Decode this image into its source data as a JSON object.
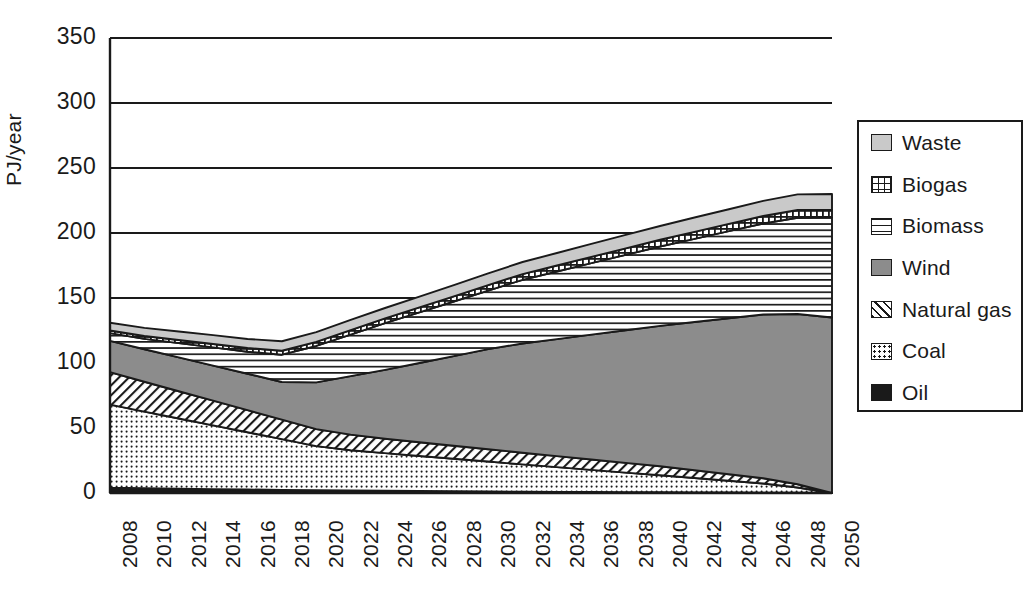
{
  "chart_data": {
    "type": "area",
    "stacked": true,
    "title": "",
    "subtitle": "",
    "xlabel": "",
    "ylabel": "PJ/year",
    "ylim": [
      0,
      350
    ],
    "ytick_values": [
      0,
      50,
      100,
      150,
      200,
      250,
      300,
      350
    ],
    "ytick_labels": [
      "0",
      "50",
      "100",
      "150",
      "200",
      "250",
      "300",
      "350"
    ],
    "grid": "horizontal",
    "legend_position": "right-outside",
    "x": [
      2008,
      2010,
      2012,
      2014,
      2016,
      2018,
      2020,
      2022,
      2024,
      2026,
      2028,
      2030,
      2032,
      2034,
      2036,
      2038,
      2040,
      2042,
      2044,
      2046,
      2048,
      2050
    ],
    "xtick_labels": [
      "2008",
      "2010",
      "2012",
      "2014",
      "2016",
      "2018",
      "2020",
      "2022",
      "2024",
      "2026",
      "2028",
      "2030",
      "2032",
      "2034",
      "2036",
      "2038",
      "2040",
      "2042",
      "2044",
      "2046",
      "2048",
      "2050"
    ],
    "stack_order_bottom_to_top": [
      "Oil",
      "Coal",
      "Natural gas",
      "Wind",
      "Biomass",
      "Biogas",
      "Waste"
    ],
    "series": [
      {
        "name": "Oil",
        "color": "#1a1a1a",
        "pattern": "solid-black",
        "values": [
          4,
          3.6,
          3.3,
          3.0,
          2.7,
          2.4,
          2.1,
          1.9,
          1.7,
          1.5,
          1.3,
          1.2,
          1.0,
          0.9,
          0.8,
          0.7,
          0.6,
          0.5,
          0.4,
          0.3,
          0.2,
          0
        ]
      },
      {
        "name": "Coal",
        "color": "#ffffff",
        "pattern": "fine-dots",
        "values": [
          64,
          59,
          54,
          49,
          44,
          39,
          34,
          31,
          29,
          27,
          25,
          23,
          21,
          19,
          17,
          15,
          13,
          11,
          9,
          7,
          4,
          0
        ]
      },
      {
        "name": "Natural gas",
        "color": "#ffffff",
        "pattern": "diagonal-hatch",
        "values": [
          25,
          23,
          21,
          19,
          17,
          15,
          13,
          12,
          11,
          10.5,
          10,
          9.5,
          9,
          8.5,
          8,
          7.5,
          7,
          6,
          5,
          4,
          2.5,
          0
        ]
      },
      {
        "name": "Wind",
        "color": "#8c8c8c",
        "pattern": "solid-gray",
        "values": [
          24,
          25,
          26,
          27,
          28,
          29,
          36,
          45,
          53,
          61,
          69,
          77,
          84,
          90,
          96,
          102,
          108,
          114,
          120,
          126,
          131,
          135
        ]
      },
      {
        "name": "Biomass",
        "color": "#ffffff",
        "pattern": "horizontal-lines",
        "values": [
          6,
          8,
          11,
          14,
          17,
          21,
          28,
          32,
          36,
          39,
          42,
          45,
          49,
          52,
          55,
          58,
          61,
          64,
          67,
          70,
          74,
          77
        ]
      },
      {
        "name": "Biogas",
        "color": "#ffffff",
        "pattern": "checkered-dots",
        "values": [
          2,
          2.2,
          2.4,
          2.6,
          2.8,
          3,
          3.2,
          3.4,
          3.6,
          3.8,
          4,
          4.2,
          4.4,
          4.6,
          4.8,
          5,
          5.2,
          5.4,
          5.6,
          5.8,
          6,
          6
        ]
      },
      {
        "name": "Waste",
        "color": "#c9c9c9",
        "pattern": "light-gray",
        "values": [
          6,
          6.2,
          6.5,
          6.8,
          7,
          7.3,
          7.5,
          7.8,
          8,
          8.3,
          8.6,
          9,
          9.3,
          9.6,
          10,
          10.3,
          10.6,
          11,
          11.3,
          11.6,
          12,
          12
        ]
      }
    ],
    "totals": [
      131,
      127,
      124,
      122,
      118,
      117,
      124,
      133,
      142,
      151,
      160,
      169,
      178,
      185,
      192,
      199,
      205,
      212,
      218,
      225,
      230,
      230
    ]
  },
  "legend": {
    "items": [
      {
        "label": "Waste",
        "swatch": "sw-waste"
      },
      {
        "label": "Biogas",
        "swatch": "sw-biogas"
      },
      {
        "label": "Biomass",
        "swatch": "sw-biomass"
      },
      {
        "label": "Wind",
        "swatch": "sw-wind"
      },
      {
        "label": "Natural gas",
        "swatch": "sw-gas"
      },
      {
        "label": "Coal",
        "swatch": "sw-coal"
      },
      {
        "label": "Oil",
        "swatch": "sw-oil"
      }
    ]
  },
  "colors": {
    "axis": "#1a1a1a",
    "waste": "#c9c9c9",
    "wind": "#8c8c8c",
    "oil": "#1a1a1a",
    "background": "#ffffff"
  }
}
